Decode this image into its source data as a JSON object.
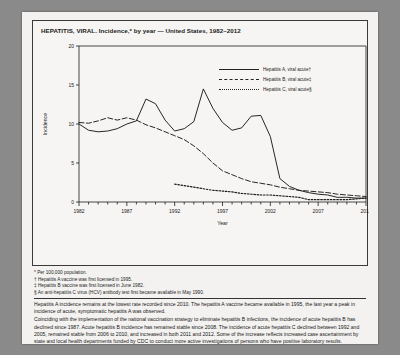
{
  "figure": {
    "title": "HEPATITIS, VIRAL. Incidence,* by year — United States, 1982–2012"
  },
  "legend": {
    "position": "top-right",
    "items": [
      {
        "label": "Hepatitis A, viral acute†",
        "style": "solid"
      },
      {
        "label": "Hepatitis B, viral acute‡",
        "style": "dashed"
      },
      {
        "label": "Hepatitis C, viral acute§",
        "style": "dotted"
      }
    ]
  },
  "footnotes": [
    "* Per 100,000 population.",
    "† Hepatitis A vaccine was first licensed in 1995.",
    "‡ Hepatitis B vaccine was first licensed in June 1982.",
    "§ An anti-hepatitis C virus (HCV) antibody test first became available in May 1990."
  ],
  "body_text": [
    "Hepatitis A incidence remains at the lowest rate recorded since 2010. The hepatitis A vaccine became available in 1995, the last year a peak in incidence of acute, symptomatic hepatitis A was observed.",
    "Coinciding with the implementation of the national vaccination strategy to eliminate hepatitis B infections, the incidence of acute hepatitis B has declined since 1987. Acute hepatitis B incidence has remained stable since 2008. The incidence of acute hepatitis C declined between 1992 and 2005, remained stable from 2006 to 2010, and increased in both 2011 and 2012. Some of the increase reflects increased case ascertainment by state and local health departments funded by CDC to conduct more active investigations of persons who have positive laboratory results."
  ],
  "chart_data": {
    "type": "line",
    "title": "HEPATITIS, VIRAL. Incidence,* by year — United States, 1982–2012",
    "xlabel": "Year",
    "ylabel": "Incidence",
    "xlim": [
      1982,
      2012
    ],
    "ylim": [
      0,
      20
    ],
    "yticks": [
      0,
      5,
      10,
      15,
      20
    ],
    "xticks": [
      1982,
      1987,
      1992,
      1997,
      2002,
      2007,
      2012
    ],
    "grid": false,
    "x": [
      1982,
      1983,
      1984,
      1985,
      1986,
      1987,
      1988,
      1989,
      1990,
      1991,
      1992,
      1993,
      1994,
      1995,
      1996,
      1997,
      1998,
      1999,
      2000,
      2001,
      2002,
      2003,
      2004,
      2005,
      2006,
      2007,
      2008,
      2009,
      2010,
      2011,
      2012
    ],
    "series": [
      {
        "name": "Hepatitis A, viral acute†",
        "style": "solid",
        "values": [
          10.0,
          9.2,
          9.0,
          9.1,
          9.4,
          10.0,
          10.4,
          13.2,
          12.6,
          10.5,
          9.1,
          9.4,
          10.3,
          14.5,
          12.0,
          10.2,
          9.2,
          9.5,
          11.0,
          11.1,
          8.4,
          3.0,
          2.0,
          1.5,
          1.2,
          1.0,
          0.9,
          0.6,
          0.6,
          0.5,
          0.5
        ]
      },
      {
        "name": "Hepatitis B, viral acute‡",
        "style": "dashed",
        "values": [
          10.2,
          10.1,
          10.4,
          10.8,
          10.5,
          10.8,
          10.5,
          9.9,
          9.5,
          9.0,
          8.5,
          8.0,
          7.2,
          6.2,
          5.0,
          4.0,
          3.5,
          3.0,
          2.6,
          2.4,
          2.2,
          1.9,
          1.7,
          1.5,
          1.4,
          1.3,
          1.2,
          1.0,
          0.9,
          0.8,
          0.7
        ]
      },
      {
        "name": "Hepatitis C, viral acute§",
        "style": "dotted",
        "values": [
          null,
          null,
          null,
          null,
          null,
          null,
          null,
          null,
          null,
          null,
          2.3,
          2.1,
          1.9,
          1.7,
          1.5,
          1.4,
          1.3,
          1.1,
          1.0,
          0.9,
          0.9,
          0.8,
          0.7,
          0.6,
          0.3,
          0.3,
          0.3,
          0.3,
          0.3,
          0.4,
          0.5
        ]
      }
    ]
  }
}
